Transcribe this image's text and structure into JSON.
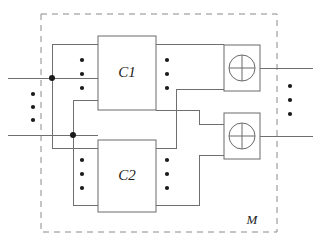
{
  "diagram": {
    "title": "M",
    "enclosure_label": "M",
    "components": [
      {
        "id": "c1",
        "label": "C1",
        "x": 98,
        "y": 36,
        "w": 58,
        "h": 74
      },
      {
        "id": "c2",
        "label": "C2",
        "x": 98,
        "y": 140,
        "w": 58,
        "h": 72
      }
    ],
    "gates": [
      {
        "id": "xor1",
        "label": "xor-gate",
        "symbol": "⊕",
        "x": 224,
        "y": 45,
        "w": 36,
        "h": 46,
        "cx": 242,
        "cy": 68,
        "r": 13
      },
      {
        "id": "xor2",
        "label": "xor-gate",
        "symbol": "⊕",
        "x": 224,
        "y": 113,
        "w": 36,
        "h": 46,
        "cx": 242,
        "cy": 136,
        "r": 13
      }
    ],
    "inputs": [
      {
        "id": "in1",
        "y": 78,
        "x_start": 8,
        "x_end": 98,
        "junction_x": 52
      },
      {
        "id": "in2",
        "y": 135,
        "x_start": 8,
        "x_end": 98,
        "junction_x": 73
      }
    ],
    "outputs": [
      {
        "id": "out1",
        "y": 68,
        "x_start": 260,
        "x_end": 313
      },
      {
        "id": "out2",
        "y": 136,
        "x_start": 260,
        "x_end": 313
      }
    ],
    "enclosure": {
      "x": 41,
      "y": 14,
      "w": 236,
      "h": 218
    },
    "ellipsis_groups": [
      {
        "id": "left-inputs-ellipsis",
        "cx": 33,
        "ys": [
          94,
          107,
          120
        ]
      },
      {
        "id": "c1-inputs-ellipsis",
        "cx": 82,
        "ys": [
          60,
          74,
          88
        ]
      },
      {
        "id": "c1-outputs-ellipsis",
        "cx": 167,
        "ys": [
          60,
          74,
          88
        ]
      },
      {
        "id": "c2-inputs-ellipsis",
        "cx": 82,
        "ys": [
          160,
          174,
          188
        ]
      },
      {
        "id": "c2-outputs-ellipsis",
        "cx": 167,
        "ys": [
          160,
          174,
          188
        ]
      },
      {
        "id": "right-outputs-ellipsis",
        "cx": 290,
        "ys": [
          86,
          100,
          114
        ]
      }
    ],
    "junction_dots": [
      {
        "id": "junction-in1",
        "cx": 52,
        "cy": 78,
        "r": 3
      },
      {
        "id": "junction-in2",
        "cx": 73,
        "cy": 135,
        "r": 3
      }
    ],
    "colors": {
      "wire": "#6f6f6f",
      "box": "#6a6a6a",
      "dash": "#8a8a8a",
      "dot": "#1a1a1a",
      "background": "#ffffff",
      "text": "#1c1c1c"
    }
  }
}
